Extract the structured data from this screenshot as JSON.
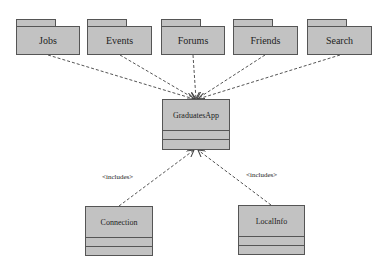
{
  "diagram": {
    "type": "UML package/class diagram",
    "packages": [
      {
        "label": "Jobs"
      },
      {
        "label": "Events"
      },
      {
        "label": "Forums"
      },
      {
        "label": "Friends"
      },
      {
        "label": "Search"
      }
    ],
    "main_class": {
      "label": "GraduatesApp"
    },
    "included_classes": [
      {
        "label": "Connection",
        "stereotype": "<includes>"
      },
      {
        "label": "LocalInfo",
        "stereotype": "<includes>"
      }
    ],
    "colors": {
      "fill": "#c2c2c2",
      "stroke": "#555555",
      "edge": "#555555"
    }
  }
}
